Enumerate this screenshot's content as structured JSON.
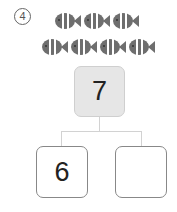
{
  "problem": {
    "number_label": "4",
    "fish_rows": [
      3,
      4
    ],
    "fish_icon": "striped-fish-icon",
    "colors": {
      "fish_body": "#6e6e6e",
      "fish_stripe": "#ffffff",
      "top_box_bg": "#e6e6e6",
      "connector": "#d2d2d2"
    }
  },
  "number_bond": {
    "whole": "7",
    "parts": [
      {
        "value": "6"
      },
      {
        "value": ""
      }
    ]
  }
}
